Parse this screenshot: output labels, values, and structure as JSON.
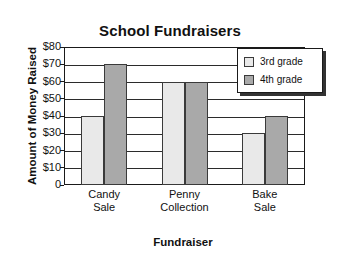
{
  "chart_data": {
    "type": "bar",
    "title": "School Fundraisers",
    "xlabel": "Fundraiser",
    "ylabel": "Amount of Money Raised",
    "categories": [
      "Candy Sale",
      "Penny Collection",
      "Bake Sale"
    ],
    "category_lines": [
      [
        "Candy",
        "Sale"
      ],
      [
        "Penny",
        "Collection"
      ],
      [
        "Bake",
        "Sale"
      ]
    ],
    "series": [
      {
        "name": "3rd grade",
        "color": "#e9e9e9",
        "values": [
          40,
          60,
          30
        ]
      },
      {
        "name": "4th grade",
        "color": "#a9a9a9",
        "values": [
          70,
          60,
          40
        ]
      }
    ],
    "ylim": [
      0,
      80
    ],
    "ytick_values": [
      0,
      10,
      20,
      30,
      40,
      50,
      60,
      70,
      80
    ],
    "ytick_labels": [
      "0",
      "$10",
      "$20",
      "$30",
      "$40",
      "$50",
      "$60",
      "$70",
      "$80"
    ],
    "grid": true,
    "legend_position": "top-right"
  },
  "legend": {
    "entries": [
      {
        "label": "3rd grade"
      },
      {
        "label": "4th grade"
      }
    ]
  }
}
